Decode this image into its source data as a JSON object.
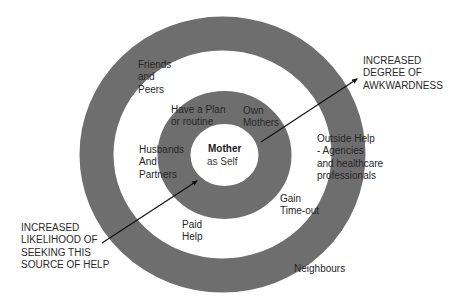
{
  "diagram": {
    "title": "",
    "colors": {
      "ring": "#6e6e6e",
      "background": "#ffffff",
      "text": "#262626",
      "arrow": "#111111"
    },
    "center": {
      "title": "Mother",
      "subtitle": "as Self"
    },
    "inner_ring_labels": {
      "plan": "Have a Plan\nor routine",
      "own_mothers": "Own\nMothers"
    },
    "middle_band_labels": {
      "husbands": "Husbands\nAnd\nPartners",
      "paid_help": "Paid\nHelp",
      "gain_timeout": "Gain\nTime-out"
    },
    "outer_ring_labels": {
      "friends": "Friends\nand\nPeers",
      "outside_help": "Outside Help\n- Agencies\nand healthcare\nprofessionals",
      "neighbours": "Neighbours"
    },
    "annotations": {
      "awkwardness": "INCREASED\nDEGREE OF\nAWKWARDNESS",
      "likelihood": "INCREASED\nLIKELIHOOD OF\nSEEKING THIS\nSOURCE OF HELP"
    },
    "arrows": [
      {
        "name": "awkwardness-arrow",
        "from": "center",
        "to": "upper-right",
        "direction": "outward"
      },
      {
        "name": "likelihood-arrow",
        "from": "lower-left",
        "to": "center",
        "direction": "inward"
      }
    ]
  }
}
